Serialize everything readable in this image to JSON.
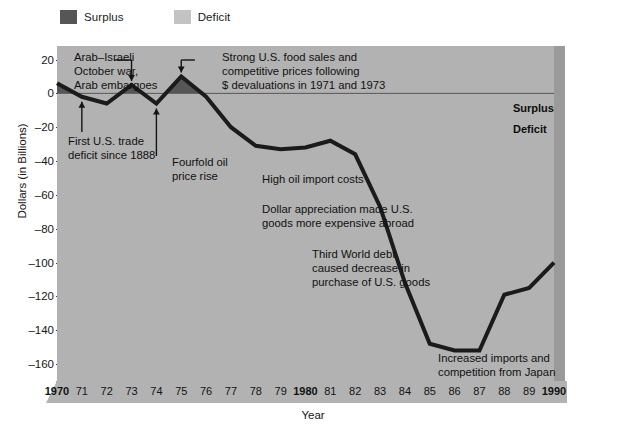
{
  "legend": {
    "items": [
      {
        "label": "Surplus",
        "color": "#565656"
      },
      {
        "label": "Deficit",
        "color": "#c3c3c3"
      }
    ]
  },
  "axes": {
    "ylabel": "Dollars (in Billions)",
    "xlabel": "Year",
    "yticks": [
      "20",
      "0",
      "–20",
      "–40",
      "–60",
      "–80",
      "–100",
      "–120",
      "–140",
      "–160"
    ],
    "xticks": [
      "1970",
      "71",
      "72",
      "73",
      "74",
      "75",
      "76",
      "77",
      "78",
      "79",
      "1980",
      "81",
      "82",
      "83",
      "84",
      "85",
      "86",
      "87",
      "88",
      "89",
      "1990"
    ]
  },
  "edge_labels": {
    "surplus": "Surplus",
    "deficit": "Deficit"
  },
  "annotations": {
    "arab_israeli": "Arab–Israeli\nOctober war,\nArab embargoes",
    "strong_food_sales": "Strong U.S. food sales and\ncompetitive prices following\n$ devaluations in 1971 and 1973",
    "first_deficit": "First U.S. trade\ndeficit since 1888",
    "fourfold_oil": "Fourfold oil\nprice rise",
    "high_oil": "High oil import costs",
    "dollar_appreciation": "Dollar appreciation made U.S.\ngoods more expensive abroad",
    "third_world_debt": "Third World debt\ncaused decrease in\npurchase of U.S. goods",
    "increased_imports": "Increased imports and\ncompetition from Japan"
  },
  "colors": {
    "plot_background": "#b2b2b2",
    "line": "#1b1b1b",
    "surplus_fill": "#565656",
    "deficit_fill": "#b2b2b2",
    "zero_line": "#5a5a5a",
    "side_panel": "#9a9a9a"
  },
  "chart_data": {
    "type": "line",
    "title": "",
    "xlabel": "Year",
    "ylabel": "Dollars (in Billions)",
    "xlim": [
      1970,
      1990
    ],
    "ylim": [
      -170,
      28
    ],
    "grid": false,
    "legend_position": "top-left",
    "x": [
      1970,
      1971,
      1972,
      1973,
      1974,
      1975,
      1976,
      1977,
      1978,
      1979,
      1980,
      1981,
      1982,
      1983,
      1984,
      1985,
      1986,
      1987,
      1988,
      1989,
      1990
    ],
    "series": [
      {
        "name": "U.S. balance of trade",
        "values": [
          6,
          -2,
          -6,
          5,
          -6,
          10,
          -2,
          -20,
          -31,
          -33,
          -32,
          -28,
          -36,
          -67,
          -112,
          -148,
          -152,
          -152,
          -119,
          -115,
          -100
        ]
      }
    ],
    "zero_reference_line": 0,
    "fill_above_zero_label": "Surplus",
    "fill_below_zero_label": "Deficit",
    "annotations": [
      {
        "text": "Arab–Israeli October war, Arab embargoes",
        "points_to_year": 1973
      },
      {
        "text": "Strong U.S. food sales and competitive prices following $ devaluations in 1971 and 1973",
        "points_to_year": 1975
      },
      {
        "text": "First U.S. trade deficit since 1888",
        "points_to_year": 1971
      },
      {
        "text": "Fourfold oil price rise",
        "points_to_year": 1974
      },
      {
        "text": "High oil import costs",
        "points_to_year": 1978
      },
      {
        "text": "Dollar appreciation made U.S. goods more expensive abroad",
        "points_to_year": 1981
      },
      {
        "text": "Third World debt caused decrease in purchase of U.S. goods",
        "points_to_year": 1983
      },
      {
        "text": "Increased imports and competition from Japan",
        "points_to_year": 1986
      }
    ]
  }
}
